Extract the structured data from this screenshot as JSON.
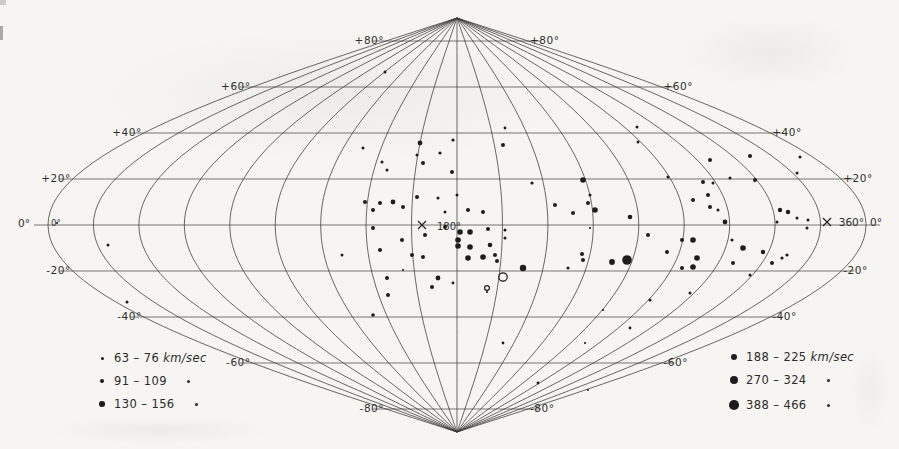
{
  "figure": {
    "background": "#f6f5f1",
    "ink": "#3a3a3a",
    "dot_color": "#1d1d1d"
  },
  "chart_data": {
    "type": "scatter",
    "projection": {
      "kind": "sinusoidal",
      "cx": 457,
      "cy": 225,
      "half_width": 409,
      "half_height": 207,
      "lon_step_deg": 20,
      "lat_step_deg": 20
    },
    "parallel_labels": [
      {
        "lat": 80,
        "left": "+80°",
        "right": "+80°"
      },
      {
        "lat": 60,
        "left": "+60°",
        "right": "+60°"
      },
      {
        "lat": 40,
        "left": "+40°",
        "right": "+40°"
      },
      {
        "lat": 20,
        "left": "+20°",
        "right": "+20°"
      },
      {
        "lat": -20,
        "left": "-20°",
        "right": "-20°"
      },
      {
        "lat": -40,
        "left": "-40°",
        "right": "-40°"
      },
      {
        "lat": -60,
        "left": "-60°",
        "right": "-60°"
      },
      {
        "lat": -80,
        "left": "-80°",
        "right": "-80°"
      }
    ],
    "equator_labels": {
      "outer_left": "0°",
      "inner_left": "0°",
      "center": "180°",
      "right_360": "360°",
      "right_0": "0°"
    },
    "x_marks": [
      {
        "x": 422,
        "y": 225
      },
      {
        "x": 827,
        "y": 222
      }
    ],
    "points_format": "[x_px, y_px, radius_px, open_flag]",
    "points": [
      [
        385,
        72,
        1.5
      ],
      [
        363,
        148,
        1.5
      ],
      [
        382,
        162,
        1.5
      ],
      [
        387,
        170,
        1.5
      ],
      [
        420,
        143,
        2.4
      ],
      [
        417,
        155,
        1.5
      ],
      [
        440,
        153,
        1.6
      ],
      [
        423,
        163,
        2
      ],
      [
        453,
        140,
        1.6
      ],
      [
        452,
        172,
        2
      ],
      [
        503,
        145,
        2
      ],
      [
        505,
        128,
        1.4
      ],
      [
        532,
        183,
        1.6
      ],
      [
        637,
        127,
        1.5
      ],
      [
        638,
        142,
        1.5
      ],
      [
        365,
        202,
        2
      ],
      [
        380,
        203,
        2
      ],
      [
        393,
        202,
        2.4
      ],
      [
        403,
        207,
        2
      ],
      [
        373,
        210,
        2
      ],
      [
        417,
        197,
        2
      ],
      [
        438,
        198,
        1.5
      ],
      [
        457,
        195,
        1.5
      ],
      [
        445,
        212,
        1.5
      ],
      [
        468,
        210,
        2
      ],
      [
        483,
        212,
        2
      ],
      [
        583,
        180,
        2.8
      ],
      [
        590,
        195,
        1.5
      ],
      [
        588,
        203,
        2
      ],
      [
        595,
        210,
        2.8
      ],
      [
        555,
        205,
        2
      ],
      [
        573,
        213,
        2
      ],
      [
        630,
        217,
        2.3
      ],
      [
        668,
        177,
        1.5
      ],
      [
        703,
        182,
        2
      ],
      [
        713,
        183,
        1.5
      ],
      [
        710,
        160,
        2
      ],
      [
        750,
        156,
        2
      ],
      [
        730,
        178,
        1.5
      ],
      [
        797,
        173,
        1.5
      ],
      [
        800,
        157,
        1.5
      ],
      [
        755,
        180,
        2
      ],
      [
        693,
        200,
        2
      ],
      [
        708,
        195,
        2
      ],
      [
        710,
        207,
        2
      ],
      [
        718,
        210,
        1.5
      ],
      [
        725,
        222,
        2.4
      ],
      [
        780,
        210,
        2.2
      ],
      [
        788,
        212,
        2.2
      ],
      [
        777,
        222,
        1.5
      ],
      [
        797,
        218,
        1.5
      ],
      [
        808,
        220,
        1.5
      ],
      [
        57,
        223,
        1.1
      ],
      [
        108,
        245,
        1.5
      ],
      [
        342,
        255,
        1.5
      ],
      [
        127,
        302,
        1.5
      ],
      [
        373,
        228,
        2
      ],
      [
        445,
        227,
        2
      ],
      [
        425,
        235,
        2
      ],
      [
        460,
        232,
        2.8
      ],
      [
        470,
        232,
        2.8
      ],
      [
        488,
        229,
        2
      ],
      [
        505,
        230,
        1.5
      ],
      [
        458,
        240,
        2.8
      ],
      [
        458,
        246,
        2.8
      ],
      [
        470,
        247,
        2.8
      ],
      [
        490,
        245,
        2.3
      ],
      [
        505,
        238,
        1.5
      ],
      [
        402,
        240,
        2
      ],
      [
        380,
        250,
        2
      ],
      [
        412,
        255,
        2
      ],
      [
        423,
        257,
        2
      ],
      [
        468,
        258,
        2.8
      ],
      [
        483,
        257,
        2.8
      ],
      [
        495,
        255,
        2
      ],
      [
        497,
        261,
        2
      ],
      [
        403,
        270,
        1.1
      ],
      [
        387,
        278,
        2
      ],
      [
        438,
        278,
        2.4
      ],
      [
        453,
        283,
        1.4
      ],
      [
        432,
        287,
        2
      ],
      [
        523,
        268,
        3.2
      ],
      [
        503,
        277,
        4.2,
        1
      ],
      [
        487,
        288,
        2.4,
        1
      ],
      [
        388,
        295,
        2
      ],
      [
        373,
        315,
        1.8
      ],
      [
        590,
        228,
        1.1
      ],
      [
        648,
        235,
        2
      ],
      [
        682,
        240,
        2
      ],
      [
        693,
        240,
        2.8
      ],
      [
        667,
        252,
        2
      ],
      [
        582,
        254,
        2
      ],
      [
        583,
        260,
        2
      ],
      [
        612,
        262,
        2.9
      ],
      [
        627,
        260,
        4.8
      ],
      [
        697,
        258,
        2.8
      ],
      [
        693,
        267,
        2.8
      ],
      [
        682,
        268,
        2
      ],
      [
        568,
        268,
        1.5
      ],
      [
        732,
        240,
        1.5
      ],
      [
        743,
        248,
        2.8
      ],
      [
        733,
        263,
        2
      ],
      [
        807,
        228,
        1.5
      ],
      [
        763,
        252,
        2.2
      ],
      [
        787,
        255,
        1.6
      ],
      [
        782,
        258,
        1.6
      ],
      [
        772,
        263,
        2
      ],
      [
        750,
        275,
        1.5
      ],
      [
        487,
        292,
        1.1
      ],
      [
        650,
        300,
        1.5
      ],
      [
        690,
        293,
        1.5
      ],
      [
        603,
        310,
        1.1
      ],
      [
        630,
        328,
        1.4
      ],
      [
        503,
        343,
        1.4
      ],
      [
        585,
        343,
        1.1
      ],
      [
        538,
        383,
        1.4
      ],
      [
        588,
        390,
        1
      ]
    ],
    "legend_left": {
      "rows": [
        {
          "range": "63 – 76",
          "unit": "km/sec",
          "dot_d": 3,
          "trailing": false
        },
        {
          "range": "91 – 109",
          "unit": "",
          "dot_d": 4.5,
          "trailing": true
        },
        {
          "range": "130 – 156",
          "unit": "",
          "dot_d": 5.5,
          "trailing": true
        }
      ]
    },
    "legend_right": {
      "rows": [
        {
          "range": "188 – 225",
          "unit": "km/sec",
          "dot_d": 6,
          "trailing": false
        },
        {
          "range": "270 – 324",
          "unit": "",
          "dot_d": 8,
          "trailing": true
        },
        {
          "range": "388 – 466",
          "unit": "",
          "dot_d": 9.5,
          "trailing": true
        }
      ]
    }
  }
}
